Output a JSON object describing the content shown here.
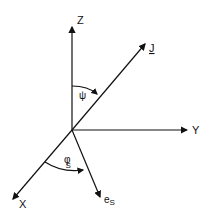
{
  "diagram": {
    "axes": {
      "z_label": "Z",
      "y_label": "Y",
      "x_label": "X",
      "j_label": "J",
      "es_label": "e",
      "es_sub": "S"
    },
    "angles": {
      "psi_label": "ψ",
      "phi_label": "φ",
      "phi_sub": "S"
    },
    "colors": {
      "stroke": "#111111",
      "background": "#ffffff"
    }
  }
}
